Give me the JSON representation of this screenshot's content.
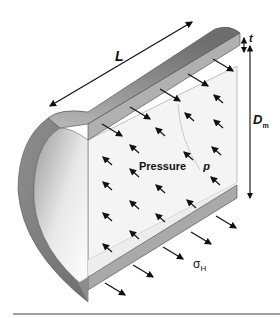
{
  "diagram": {
    "labels": {
      "length": "L",
      "thickness": "t",
      "diameter": "D",
      "diameter_sub": "m",
      "pressure_word": "Pressure",
      "pressure_symbol": "p",
      "hoop_stress": "σ",
      "hoop_stress_sub": "H"
    },
    "colors": {
      "wall_dark": "#7a7a7a",
      "wall_mid": "#a8a8a8",
      "wall_edge": "#b5b5b5",
      "inner_face": "#f2f2f2",
      "arrow": "#111111",
      "rule": "#444444"
    }
  }
}
